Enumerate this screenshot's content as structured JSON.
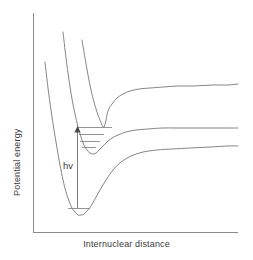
{
  "figure": {
    "width": 253,
    "height": 260,
    "background": "#ffffff",
    "line_color": "#777777",
    "axis_color": "#8c8c8c",
    "text_color": "#3c3c3c"
  },
  "axes": {
    "y_title": "Potential energy",
    "x_title": "Internuclear distance",
    "origin_x": 33,
    "origin_y": 232,
    "top_y": 13,
    "right_x": 238,
    "ticks": [],
    "tick_labels": []
  },
  "annotations": {
    "transition_label": "hv"
  },
  "chart_data": {
    "type": "line",
    "title": "",
    "subtitle": "",
    "xlabel": "Internuclear distance",
    "ylabel": "Potential energy",
    "xlim": [
      33,
      238
    ],
    "ylim": [
      232,
      13
    ],
    "grid": false,
    "legend": null,
    "axis_ticks_shown": false,
    "series": [
      {
        "name": "ground-state-morse-curve",
        "kind": "bound-morse",
        "points": [
          [
            45,
            62
          ],
          [
            48,
            88
          ],
          [
            51,
            110
          ],
          [
            54,
            130
          ],
          [
            57,
            148
          ],
          [
            60,
            165
          ],
          [
            63,
            180
          ],
          [
            66,
            192
          ],
          [
            69,
            201
          ],
          [
            72,
            208
          ],
          [
            75,
            212
          ],
          [
            78,
            215
          ],
          [
            81,
            215
          ],
          [
            84,
            214
          ],
          [
            87,
            211
          ],
          [
            91,
            206
          ],
          [
            95,
            199
          ],
          [
            100,
            190
          ],
          [
            106,
            180
          ],
          [
            113,
            170
          ],
          [
            121,
            162
          ],
          [
            131,
            156
          ],
          [
            143,
            152
          ],
          [
            157,
            150
          ],
          [
            172,
            149
          ],
          [
            190,
            148
          ],
          [
            210,
            147
          ],
          [
            228,
            146
          ],
          [
            238,
            146
          ]
        ],
        "asymptote_y": 146
      },
      {
        "name": "excited-state-morse-curve",
        "kind": "bound-morse",
        "points": [
          [
            63,
            32
          ],
          [
            66,
            58
          ],
          [
            69,
            80
          ],
          [
            72,
            99
          ],
          [
            75,
            114
          ],
          [
            78,
            127
          ],
          [
            81,
            137
          ],
          [
            84,
            145
          ],
          [
            87,
            150
          ],
          [
            90,
            153
          ],
          [
            93,
            154
          ],
          [
            96,
            153
          ],
          [
            99,
            150
          ],
          [
            103,
            146
          ],
          [
            107,
            142
          ],
          [
            112,
            138
          ],
          [
            118,
            135
          ],
          [
            126,
            132
          ],
          [
            136,
            130
          ],
          [
            148,
            129
          ],
          [
            162,
            128
          ],
          [
            178,
            128
          ],
          [
            196,
            128
          ],
          [
            215,
            128
          ],
          [
            232,
            128
          ],
          [
            238,
            128
          ]
        ],
        "asymptote_y": 128
      },
      {
        "name": "repulsive-dissociative-curve",
        "kind": "repulsive",
        "points": [
          [
            82,
            40
          ],
          [
            85,
            58
          ],
          [
            88,
            75
          ],
          [
            91,
            90
          ],
          [
            94,
            102
          ],
          [
            97,
            112
          ],
          [
            100,
            120
          ],
          [
            104,
            127
          ],
          [
            108,
            111
          ],
          [
            112,
            104
          ],
          [
            117,
            98
          ],
          [
            123,
            94
          ],
          [
            130,
            91
          ],
          [
            139,
            89
          ],
          [
            150,
            88
          ],
          [
            163,
            87
          ],
          [
            178,
            86
          ],
          [
            194,
            86
          ],
          [
            212,
            85
          ],
          [
            228,
            85
          ],
          [
            238,
            84
          ]
        ],
        "asymptote_y": 85
      }
    ],
    "vibrational_levels": {
      "excited_state": [
        {
          "index": 3,
          "x1": 77,
          "x2": 112,
          "y": 127
        },
        {
          "index": 2,
          "x1": 79,
          "x2": 104,
          "y": 134
        },
        {
          "index": 1,
          "x1": 80,
          "x2": 100,
          "y": 141
        },
        {
          "index": 0,
          "x1": 82,
          "x2": 96,
          "y": 147
        }
      ],
      "ground_state": [
        {
          "index": 0,
          "x1": 68,
          "x2": 90,
          "y": 208
        }
      ]
    },
    "transition": {
      "label": "hv",
      "x": 77,
      "y_start": 208,
      "y_end": 127,
      "arrow_head": "up"
    }
  }
}
